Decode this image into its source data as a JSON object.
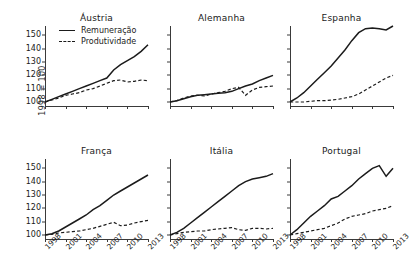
{
  "axis": {
    "ylabel": "1998 = 100",
    "yticks": [
      100,
      110,
      120,
      130,
      140,
      150
    ],
    "xticks": [
      "1998",
      "2001",
      "2004",
      "2007",
      "2010",
      "2013"
    ]
  },
  "legend": {
    "remuneracao": "Remuneração",
    "produtividade": "Produtividade"
  },
  "chart_data": {
    "type": "line",
    "title": "",
    "xlabel": "",
    "ylabel": "1998 = 100",
    "ylim": [
      97,
      157
    ],
    "xlim": [
      1998,
      2013
    ],
    "grid": false,
    "legend_position": "inside-top-left-of-first-panel",
    "x": [
      1998,
      1999,
      2000,
      2001,
      2002,
      2003,
      2004,
      2005,
      2006,
      2007,
      2008,
      2009,
      2010,
      2011,
      2012,
      2013
    ],
    "panels": [
      {
        "name": "Áustria",
        "series": [
          {
            "name": "Remuneração",
            "values": [
              100,
              102,
              104,
              106,
              108,
              110,
              112,
              114,
              116,
              118,
              124,
              128,
              131,
              134,
              138,
              143
            ]
          },
          {
            "name": "Produtividade",
            "values": [
              100,
              101.5,
              103,
              105,
              106,
              107,
              109,
              110,
              112,
              114,
              116,
              116.5,
              115,
              115.5,
              116.5,
              116
            ]
          }
        ]
      },
      {
        "name": "Alemanha",
        "series": [
          {
            "name": "Remuneração",
            "values": [
              100,
              101,
              102.5,
              104,
              105,
              105.5,
              106,
              106.5,
              107,
              108,
              110,
              112,
              113.5,
              116,
              118,
              120
            ]
          },
          {
            "name": "Produtividade",
            "values": [
              100,
              101,
              103,
              104.5,
              105,
              104.5,
              106,
              107,
              108,
              110,
              111,
              105,
              109,
              111,
              111.5,
              112
            ]
          }
        ]
      },
      {
        "name": "Espanha",
        "series": [
          {
            "name": "Remuneração",
            "values": [
              100,
              103,
              107,
              112,
              117,
              122,
              127,
              133,
              139,
              146,
              152,
              155,
              155.5,
              155,
              154,
              157
            ]
          },
          {
            "name": "Produtividade",
            "values": [
              100,
              100,
              100,
              100.5,
              101,
              101,
              101.5,
              102,
              103,
              104,
              106,
              109,
              112,
              115,
              118,
              120
            ]
          }
        ]
      },
      {
        "name": "França",
        "series": [
          {
            "name": "Remuneração",
            "values": [
              100,
              101,
              103,
              106,
              109,
              112,
              115,
              119,
              122,
              126,
              130,
              133,
              136,
              139,
              142,
              145
            ]
          },
          {
            "name": "Produtividade",
            "values": [
              100,
              100.5,
              101.5,
              102,
              102.5,
              103,
              104,
              105,
              106.5,
              108,
              109.5,
              107,
              107.5,
              109,
              110,
              111
            ]
          }
        ]
      },
      {
        "name": "Itália",
        "series": [
          {
            "name": "Remuneração",
            "values": [
              100,
              102,
              105,
              109,
              113,
              117,
              121,
              125,
              129,
              133,
              137,
              140,
              142,
              143,
              144,
              146
            ]
          },
          {
            "name": "Produtividade",
            "values": [
              100,
              101,
              102,
              102.5,
              103,
              103,
              104,
              104.5,
              105,
              105.5,
              104,
              103.5,
              105,
              105,
              104.5,
              105
            ]
          }
        ]
      },
      {
        "name": "Portugal",
        "series": [
          {
            "name": "Remuneração",
            "values": [
              100,
              104,
              109,
              114,
              118,
              122,
              127,
              129,
              133,
              137,
              142,
              146,
              150,
              152,
              144,
              150
            ]
          },
          {
            "name": "Produtividade",
            "values": [
              100,
              101,
              102,
              103,
              104,
              105,
              107,
              109,
              112,
              114,
              115,
              116,
              118,
              119,
              120,
              122
            ]
          }
        ]
      }
    ]
  }
}
